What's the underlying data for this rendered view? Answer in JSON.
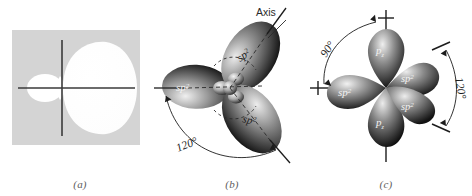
{
  "figure": {
    "background_color": "#ffffff",
    "panel_fill_color": "#d4d4d4",
    "lobe_light_color": "#e8e8e8",
    "lobe_dark_color": "#1a1a1a",
    "axis_color": "#1c1c1c"
  },
  "panels": [
    {
      "id": "a",
      "caption": "(a)",
      "description": "single sp2 hybrid orbital on shaded square background",
      "labels": []
    },
    {
      "id": "b",
      "caption": "(b)",
      "description": "three sp2 hybrid orbitals at 120 degrees",
      "labels": []
    },
    {
      "id": "c",
      "caption": "(c)",
      "description": "three sp2 orbitals plus pz orbital",
      "labels": []
    }
  ],
  "panel_a": {
    "caption": "(a)"
  },
  "panel_b": {
    "caption": "(b)",
    "axis_label": "Axis",
    "angle_label": "120°",
    "orbital_labels": [
      {
        "key": "sp2",
        "base": "sp",
        "exponent": "2"
      },
      {
        "key": "sp2",
        "base": "sp",
        "exponent": "2"
      },
      {
        "key": "sp2",
        "base": "sp",
        "exponent": "2"
      }
    ]
  },
  "panel_c": {
    "caption": "(c)",
    "angle_labels": [
      "90°",
      "120°"
    ],
    "orbital_labels": [
      {
        "key": "pz",
        "base": "p",
        "subscript": "z"
      },
      {
        "key": "sp2",
        "base": "sp",
        "exponent": "2"
      },
      {
        "key": "sp2",
        "base": "sp",
        "exponent": "2"
      },
      {
        "key": "sp2",
        "base": "sp",
        "exponent": "2"
      },
      {
        "key": "pz",
        "base": "p",
        "subscript": "z"
      }
    ]
  }
}
